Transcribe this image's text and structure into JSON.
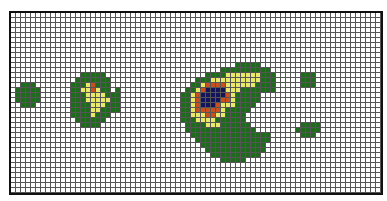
{
  "chart_data": {
    "type": "heatmap",
    "title": "",
    "xlabel": "",
    "ylabel": "",
    "grid": true,
    "columns": 74,
    "rows": 36,
    "levels": {
      "0": {
        "name": "none",
        "color": "#ffffff"
      },
      "1": {
        "name": "low",
        "color": "#1e6b1e"
      },
      "2": {
        "name": "medium",
        "color": "#e8e86a"
      },
      "3": {
        "name": "high",
        "color": "#c8501e"
      },
      "4": {
        "name": "peak",
        "color": "#14145a"
      }
    },
    "blobs": [
      {
        "name": "left-dot",
        "col": 1,
        "row": 14,
        "cells": [
          " 111 ",
          "11111",
          "11111",
          "11111",
          " 111 "
        ]
      },
      {
        "name": "second-blob",
        "col": 12,
        "row": 12,
        "cells": [
          "  11111   ",
          " 1111111  ",
          "11123111  ",
          "11223211 1",
          "1112222111",
          "1112222211",
          "1111222111",
          "1111221111",
          "11112111  ",
          " 111111   ",
          "  1111    "
        ]
      },
      {
        "name": "main-blob",
        "col": 34,
        "row": 10,
        "cells": [
          "           11111      ",
          "        1111111111    ",
          "     11112222222111   ",
          "   1112222222222111   ",
          "  11233332222221111   ",
          " 112344442221111111   ",
          "1123444443211111      ",
          "1123444433211111      ",
          "112344432221111       ",
          "11233333211111        ",
          "1122233221111         ",
          "1112222111111         ",
          " 1111222111111        ",
          " 11111111111111       ",
          "  1111111111111111    ",
          "   111111111111111    ",
          "    1111111111111     ",
          "     111111111111     ",
          "      1111111111      ",
          "        11111         "
        ]
      },
      {
        "name": "small-square",
        "col": 58,
        "row": 12,
        "cells": [
          "111",
          "111",
          "111"
        ]
      },
      {
        "name": "bottom-right-blob",
        "col": 57,
        "row": 22,
        "cells": [
          " 1111",
          "11111",
          " 111 "
        ]
      }
    ]
  }
}
